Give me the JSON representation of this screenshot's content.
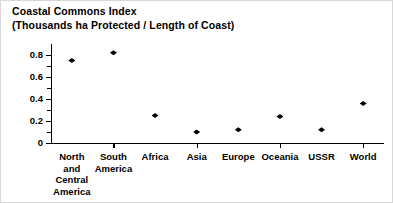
{
  "chart_data": {
    "type": "scatter",
    "title": "Coastal Commons Index",
    "subtitle": "(Thousands ha Protected / Length of Coast)",
    "title_lines": [
      "Coastal Commons Index",
      "(Thousands ha Protected / Length of Coast)"
    ],
    "categories": [
      "North and Central America",
      "South America",
      "Africa",
      "Asia",
      "Europe",
      "Oceania",
      "USSR",
      "World"
    ],
    "category_label_lines": [
      [
        "North",
        "and",
        "Central",
        "America"
      ],
      [
        "South",
        "America"
      ],
      [
        "Africa"
      ],
      [
        "Asia"
      ],
      [
        "Europe"
      ],
      [
        "Oceania"
      ],
      [
        "USSR"
      ],
      [
        "World"
      ]
    ],
    "values": [
      0.75,
      0.82,
      0.25,
      0.1,
      0.12,
      0.24,
      0.12,
      0.36
    ],
    "xlabel": "",
    "ylabel": "",
    "ylim": [
      0,
      0.9
    ],
    "ytick_labels": [
      "0",
      "0.2",
      "0.4",
      "0.6",
      "0.8"
    ],
    "ytick_values": [
      0,
      0.2,
      0.4,
      0.6,
      0.8
    ],
    "yminor_values": [
      0.1,
      0.3,
      0.5,
      0.7
    ],
    "grid": false,
    "legend": false,
    "marker": "diamond",
    "marker_color": "#000000",
    "axis_color": "#000000",
    "background": "#ffffff"
  }
}
